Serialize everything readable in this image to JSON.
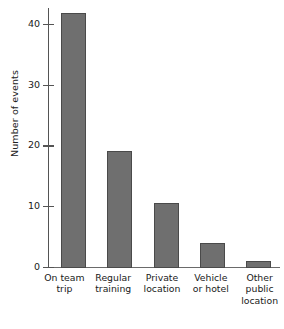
{
  "chart_data": {
    "type": "bar",
    "title": "",
    "xlabel": "",
    "ylabel": "Number of events",
    "categories": [
      "On team trip",
      "Regular training",
      "Private location",
      "Vehicle or hotel",
      "Other public location"
    ],
    "category_lines": [
      [
        "On team",
        "trip"
      ],
      [
        "Regular",
        "training"
      ],
      [
        "Private",
        "location"
      ],
      [
        "Vehicle",
        "or hotel"
      ],
      [
        "Other",
        "public",
        "location"
      ]
    ],
    "values": [
      42,
      19.3,
      10.7,
      4.2,
      1.2
    ],
    "ylim": [
      0,
      42.5
    ],
    "yticks": [
      0,
      10,
      20,
      30,
      40
    ],
    "ytick_labels": [
      "0",
      "10",
      "20",
      "30",
      "40"
    ],
    "grid": false,
    "legend": false,
    "bar_color": "#6f6f6f",
    "bar_edge_color": "#4a4a4a",
    "axis_color": "#545454",
    "background": "#ffffff"
  }
}
